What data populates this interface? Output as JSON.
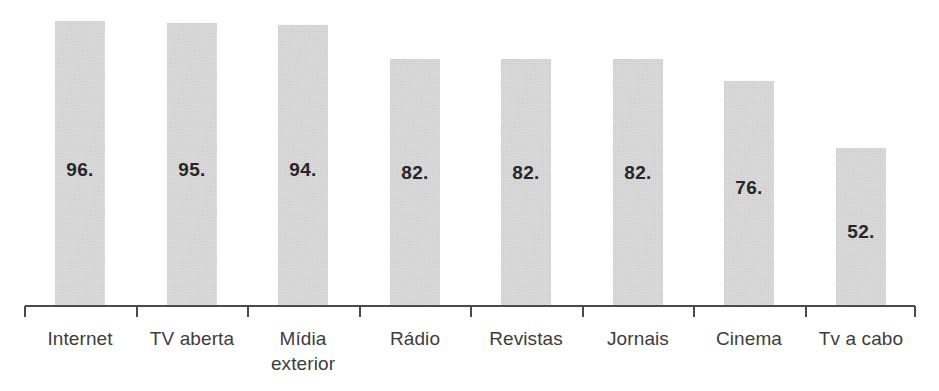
{
  "chart_data": {
    "type": "bar",
    "title": "",
    "subtitle": "",
    "xlabel": "",
    "ylabel": "",
    "grid": false,
    "legend": false,
    "orientation": "vertical",
    "ylim": [
      0,
      100
    ],
    "axis_visible": {
      "x": true,
      "y": false
    },
    "categories": [
      "Internet",
      "TV aberta",
      "Mídia\nexterior",
      "Rádio",
      "Revistas",
      "Jornais",
      "Cinema",
      "Tv a cabo"
    ],
    "values": [
      96,
      95,
      94,
      82,
      82,
      82,
      76,
      52
    ],
    "data_labels": [
      "96.",
      "95.",
      "94.",
      "82.",
      "82.",
      "82.",
      "76.",
      "52."
    ],
    "bars": [
      {
        "category": "Internet",
        "label": "Internet",
        "value": 96,
        "data_label": "96.",
        "x": 55,
        "width": 50,
        "top": 21,
        "value_label_y": 160
      },
      {
        "category": "TV aberta",
        "label": "TV aberta",
        "value": 95,
        "data_label": "95.",
        "x": 167,
        "width": 50,
        "top": 23,
        "value_label_y": 160
      },
      {
        "category": "Mídia exterior",
        "label": "Mídia\nexterior",
        "value": 94,
        "data_label": "94.",
        "x": 278,
        "width": 50,
        "top": 25,
        "value_label_y": 160
      },
      {
        "category": "Rádio",
        "label": "Rádio",
        "value": 82,
        "data_label": "82.",
        "x": 390,
        "width": 50,
        "top": 59,
        "value_label_y": 163
      },
      {
        "category": "Revistas",
        "label": "Revistas",
        "value": 82,
        "data_label": "82.",
        "x": 501,
        "width": 50,
        "top": 59,
        "value_label_y": 163
      },
      {
        "category": "Jornais",
        "label": "Jornais",
        "value": 82,
        "data_label": "82.",
        "x": 613,
        "width": 50,
        "top": 59,
        "value_label_y": 163
      },
      {
        "category": "Cinema",
        "label": "Cinema",
        "value": 76,
        "data_label": "76.",
        "x": 724,
        "width": 50,
        "top": 81,
        "value_label_y": 178
      },
      {
        "category": "Tv a cabo",
        "label": "Tv a cabo",
        "value": 52,
        "data_label": "52.",
        "x": 836,
        "width": 50,
        "top": 148,
        "value_label_y": 222
      }
    ],
    "colors": {
      "bar_fill": "#dcdcdc",
      "axis": "#4a4a4a",
      "label_text": "#3d3d3d",
      "value_text": "#272727",
      "background": "#ffffff"
    },
    "axis_geometry": {
      "baseline_y": 306,
      "x_start": 25,
      "x_end": 915,
      "tick_positions": [
        25,
        137,
        248,
        360,
        471,
        583,
        694,
        806,
        915
      ]
    }
  }
}
